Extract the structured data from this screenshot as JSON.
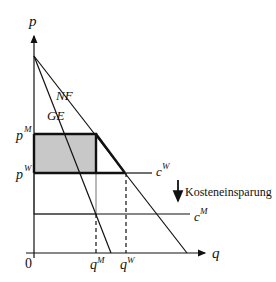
{
  "diagram": {
    "axes": {
      "y_label": "p",
      "x_label": "q",
      "origin_label": "0"
    },
    "curves": {
      "nf_label": "NF",
      "ge_label": "GE"
    },
    "price_labels": {
      "monopoly": "p",
      "monopoly_sup": "M",
      "competitive": "p",
      "competitive_sup": "W"
    },
    "quantity_labels": {
      "monopoly": "q",
      "monopoly_sup": "M",
      "competitive": "q",
      "competitive_sup": "W"
    },
    "cost_labels": {
      "cw": "c",
      "cw_sup": "W",
      "cm": "c",
      "cm_sup": "M"
    },
    "annotation": "Kosteneinsparung",
    "colors": {
      "shaded_area": "#c8c8c8",
      "gray_outline": "#8a8a8a",
      "line": "#111111"
    }
  }
}
